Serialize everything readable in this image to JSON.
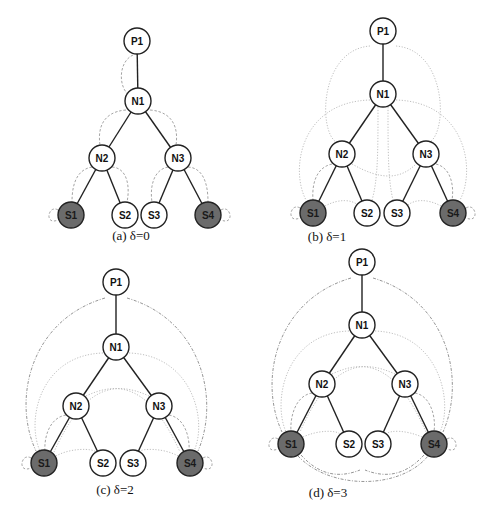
{
  "figure": {
    "colors": {
      "node_fill": "#ffffff",
      "node_fill_shaded": "#6b6b6b",
      "node_stroke": "#222222",
      "tree_edge": "#222222",
      "dep_edge_near": "#9a9a9a",
      "dep_edge_mid": "#b8b8b8",
      "dep_edge_far": "#8a8a8a"
    },
    "node_radius": 13,
    "tree_edges": [
      [
        "P1",
        "N1"
      ],
      [
        "N1",
        "N2"
      ],
      [
        "N1",
        "N3"
      ],
      [
        "N2",
        "S1"
      ],
      [
        "N2",
        "S2"
      ],
      [
        "N3",
        "S3"
      ],
      [
        "N3",
        "S4"
      ]
    ],
    "panels": [
      {
        "id": "a",
        "caption": "(a) δ=0",
        "caption_pos": [
          131,
          240
        ],
        "nodes": {
          "P1": {
            "label": "P1",
            "x": 137,
            "y": 41,
            "shaded": false
          },
          "N1": {
            "label": "N1",
            "x": 138,
            "y": 101,
            "shaded": false
          },
          "N2": {
            "label": "N2",
            "x": 102,
            "y": 158,
            "shaded": false
          },
          "N3": {
            "label": "N3",
            "x": 178,
            "y": 158,
            "shaded": false
          },
          "S1": {
            "label": "S1",
            "x": 71,
            "y": 215,
            "shaded": true
          },
          "S2": {
            "label": "S2",
            "x": 125,
            "y": 215,
            "shaded": false
          },
          "S3": {
            "label": "S3",
            "x": 154,
            "y": 215,
            "shaded": false
          },
          "S4": {
            "label": "S4",
            "x": 208,
            "y": 215,
            "shaded": true
          }
        },
        "dep_edges": [
          {
            "d": "M133,55 C118,62 118,88 130,96",
            "style": "near"
          },
          {
            "d": "M126,110 C100,112 98,132 100,145",
            "style": "near"
          },
          {
            "d": "M150,110 C176,112 178,132 176,145",
            "style": "near"
          },
          {
            "d": "M92,167 C74,170 72,190 72,202",
            "style": "near"
          },
          {
            "d": "M112,167 C128,168 130,188 127,202",
            "style": "near"
          },
          {
            "d": "M168,167 C152,170 150,190 152,202",
            "style": "near"
          },
          {
            "d": "M188,167 C206,168 208,190 208,202",
            "style": "near"
          },
          {
            "d": "M58,210 C48,204 44,226 58,220",
            "style": "near"
          },
          {
            "d": "M221,210 C231,204 235,226 221,220",
            "style": "near"
          }
        ]
      },
      {
        "id": "b",
        "caption": "(b) δ=1",
        "caption_pos": [
          327,
          241
        ],
        "nodes": {
          "P1": {
            "label": "P1",
            "x": 383,
            "y": 31,
            "shaded": false
          },
          "N1": {
            "label": "N1",
            "x": 383,
            "y": 94,
            "shaded": false
          },
          "N2": {
            "label": "N2",
            "x": 342,
            "y": 154,
            "shaded": false
          },
          "N3": {
            "label": "N3",
            "x": 426,
            "y": 154,
            "shaded": false
          },
          "S1": {
            "label": "S1",
            "x": 313,
            "y": 213,
            "shaded": true
          },
          "S2": {
            "label": "S2",
            "x": 367,
            "y": 213,
            "shaded": false
          },
          "S3": {
            "label": "S3",
            "x": 397,
            "y": 213,
            "shaded": false
          },
          "S4": {
            "label": "S4",
            "x": 453,
            "y": 213,
            "shaded": true
          }
        },
        "dep_edges": [
          {
            "d": "M370,46 C320,50 318,130 336,142",
            "style": "mid"
          },
          {
            "d": "M396,46 C446,50 448,130 430,142",
            "style": "mid"
          },
          {
            "d": "M370,100 C300,102 290,170 306,200",
            "style": "mid"
          },
          {
            "d": "M396,100 C466,102 476,170 460,200",
            "style": "mid"
          },
          {
            "d": "M378,107 C378,150 378,180 372,200",
            "style": "mid"
          },
          {
            "d": "M388,107 C388,150 388,180 393,200",
            "style": "mid"
          },
          {
            "d": "M352,164 C380,180 400,180 416,164",
            "style": "mid"
          },
          {
            "d": "M332,164 C314,168 312,188 313,200",
            "style": "near"
          },
          {
            "d": "M436,164 C452,168 454,188 452,200",
            "style": "near"
          },
          {
            "d": "M325,206 C340,198 352,200 358,205",
            "style": "mid"
          },
          {
            "d": "M441,206 C426,198 414,200 408,205",
            "style": "mid"
          },
          {
            "d": "M300,208 C290,202 286,224 300,218",
            "style": "near"
          },
          {
            "d": "M466,208 C476,202 480,224 466,218",
            "style": "near"
          }
        ]
      },
      {
        "id": "c",
        "caption": "(c) δ=2",
        "caption_pos": [
          115,
          494
        ],
        "nodes": {
          "P1": {
            "label": "P1",
            "x": 116,
            "y": 282,
            "shaded": false
          },
          "N1": {
            "label": "N1",
            "x": 116,
            "y": 347,
            "shaded": false
          },
          "N2": {
            "label": "N2",
            "x": 76,
            "y": 406,
            "shaded": false
          },
          "N3": {
            "label": "N3",
            "x": 159,
            "y": 406,
            "shaded": false
          },
          "S1": {
            "label": "S1",
            "x": 44,
            "y": 463,
            "shaded": true
          },
          "S2": {
            "label": "S2",
            "x": 103,
            "y": 463,
            "shaded": false
          },
          "S3": {
            "label": "S3",
            "x": 133,
            "y": 463,
            "shaded": false
          },
          "S4": {
            "label": "S4",
            "x": 190,
            "y": 463,
            "shaded": true
          }
        },
        "dep_edges": [
          {
            "d": "M105,298 C30,320 12,400 36,451",
            "style": "far"
          },
          {
            "d": "M127,298 C202,320 220,400 198,451",
            "style": "far"
          },
          {
            "d": "M103,353 C40,355 26,420 40,451",
            "style": "mid"
          },
          {
            "d": "M129,353 C192,355 208,420 194,451",
            "style": "mid"
          },
          {
            "d": "M86,396 C120,380 150,386 180,452",
            "style": "mid"
          },
          {
            "d": "M149,396 C114,380 84,386 54,452",
            "style": "mid"
          },
          {
            "d": "M66,415 C48,418 44,440 45,451",
            "style": "near"
          },
          {
            "d": "M169,415 C186,418 190,440 189,451",
            "style": "near"
          },
          {
            "d": "M56,456 C70,448 92,448 96,452",
            "style": "mid"
          },
          {
            "d": "M178,456 C164,448 142,448 138,452",
            "style": "mid"
          },
          {
            "d": "M31,458 C21,452 17,474 31,468",
            "style": "near"
          },
          {
            "d": "M203,458 C213,452 217,474 203,468",
            "style": "near"
          }
        ]
      },
      {
        "id": "d",
        "caption": "(d) δ=3",
        "caption_pos": [
          328,
          497
        ],
        "nodes": {
          "P1": {
            "label": "P1",
            "x": 362,
            "y": 262,
            "shaded": false
          },
          "N1": {
            "label": "N1",
            "x": 362,
            "y": 325,
            "shaded": false
          },
          "N2": {
            "label": "N2",
            "x": 322,
            "y": 384,
            "shaded": false
          },
          "N3": {
            "label": "N3",
            "x": 405,
            "y": 384,
            "shaded": false
          },
          "S1": {
            "label": "S1",
            "x": 291,
            "y": 444,
            "shaded": true
          },
          "S2": {
            "label": "S2",
            "x": 349,
            "y": 444,
            "shaded": false
          },
          "S3": {
            "label": "S3",
            "x": 378,
            "y": 444,
            "shaded": false
          },
          "S4": {
            "label": "S4",
            "x": 434,
            "y": 444,
            "shaded": true
          }
        },
        "dep_edges": [
          {
            "d": "M351,278 C276,300 258,380 282,432",
            "style": "far"
          },
          {
            "d": "M373,278 C448,300 466,380 443,432",
            "style": "far"
          },
          {
            "d": "M349,331 C286,333 272,400 286,432",
            "style": "mid"
          },
          {
            "d": "M375,331 C438,333 454,400 440,432",
            "style": "mid"
          },
          {
            "d": "M332,374 C366,358 396,364 426,432",
            "style": "mid"
          },
          {
            "d": "M395,374 C360,358 330,364 300,432",
            "style": "mid"
          },
          {
            "d": "M312,393 C294,396 290,420 291,431",
            "style": "near"
          },
          {
            "d": "M415,393 C432,396 436,420 434,431",
            "style": "near"
          },
          {
            "d": "M301,455 C320,476 340,478 360,470",
            "style": "far"
          },
          {
            "d": "M424,455 C405,476 385,478 365,470",
            "style": "far"
          },
          {
            "d": "M298,456 C330,490 400,490 428,456",
            "style": "far"
          },
          {
            "d": "M303,437 C318,430 336,430 340,434",
            "style": "mid"
          },
          {
            "d": "M422,437 C406,430 390,430 386,434",
            "style": "mid"
          },
          {
            "d": "M278,439 C268,433 264,455 278,449",
            "style": "near"
          },
          {
            "d": "M447,439 C457,433 461,455 447,449",
            "style": "near"
          }
        ]
      }
    ]
  }
}
